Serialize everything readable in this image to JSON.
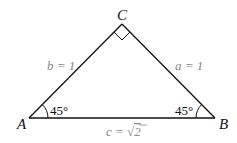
{
  "figure": {
    "type": "right isosceles triangle",
    "vertices": {
      "A": {
        "label": "A",
        "x": 29,
        "y": 118
      },
      "B": {
        "label": "B",
        "x": 215,
        "y": 118
      },
      "C": {
        "label": "C",
        "x": 122,
        "y": 24
      }
    },
    "sides": {
      "b": {
        "label": "b = 1",
        "between": "A-C"
      },
      "a": {
        "label": "a = 1",
        "between": "C-B"
      },
      "c": {
        "label_prefix": "c = ",
        "radical": "√",
        "radicand": "2",
        "between": "A-B"
      }
    },
    "angles": {
      "A": {
        "label": "45°"
      },
      "B": {
        "label": "45°"
      },
      "C": {
        "label": "right-angle"
      }
    },
    "colors": {
      "line": "#111111",
      "side_label": "#888888",
      "vertex_label": "#111111"
    }
  }
}
